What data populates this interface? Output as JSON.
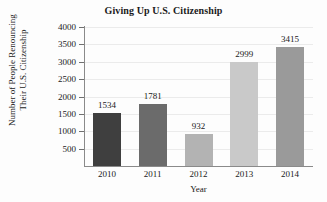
{
  "chart_data": {
    "type": "bar",
    "title": "Giving Up U.S. Citizenship",
    "xlabel": "Year",
    "ylabel_line1": "Number of People Renouncing",
    "ylabel_line2": "Their U.S. Citizenship",
    "categories": [
      "2010",
      "2011",
      "2012",
      "2013",
      "2014"
    ],
    "values": [
      1534,
      1781,
      932,
      2999,
      3415
    ],
    "value_labels": [
      "1534",
      "1781",
      "932",
      "2999",
      "3415"
    ],
    "bar_colors": [
      "#3f3f3f",
      "#6b6b6b",
      "#b3b3b3",
      "#c9c9c9",
      "#9a9a9a"
    ],
    "ylim": [
      0,
      4000
    ],
    "ytick_labels": [
      "500",
      "1000",
      "1500",
      "2000",
      "2500",
      "3000",
      "3500",
      "4000"
    ],
    "ytick_values": [
      500,
      1000,
      1500,
      2000,
      2500,
      3000,
      3500,
      4000
    ],
    "grid": true,
    "legend": "none"
  }
}
